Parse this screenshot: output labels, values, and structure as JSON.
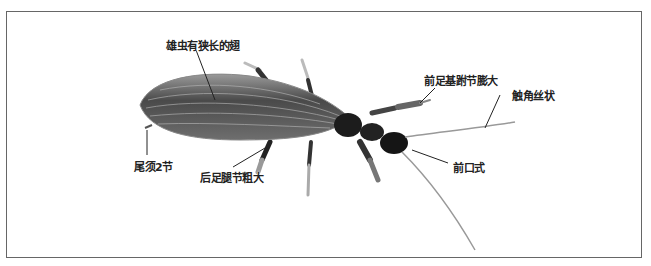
{
  "figure": {
    "labels": [
      {
        "id": "wings",
        "text": "雄虫有狭长的翅"
      },
      {
        "id": "fore-tarsus",
        "text": "前足基跗节膨大"
      },
      {
        "id": "antenna",
        "text": "触角丝状"
      },
      {
        "id": "cerci",
        "text": "尾须2节"
      },
      {
        "id": "hind-femur",
        "text": "后足腿节粗大"
      },
      {
        "id": "mouthparts",
        "text": "前口式"
      }
    ]
  }
}
